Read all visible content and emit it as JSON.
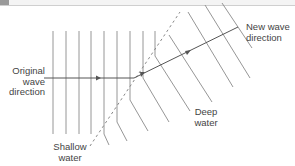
{
  "diagram": {
    "labels": {
      "original_direction": [
        "Original",
        "wave",
        "direction"
      ],
      "new_direction": [
        "New wave",
        "direction"
      ],
      "shallow_water": [
        "Shallow",
        "water"
      ],
      "deep_water": [
        "Deep",
        "water"
      ]
    },
    "colors": {
      "line": "#7a7a7a",
      "ray": "#555555",
      "text": "#444444",
      "boundary": "#888888"
    }
  }
}
